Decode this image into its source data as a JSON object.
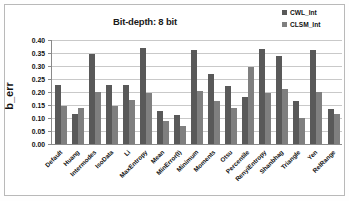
{
  "figure": {
    "title": "Bit-depth: 8 bit",
    "y_axis_title": "b_err"
  },
  "legend": {
    "position": "top-right",
    "entries": [
      {
        "label": "CWL_Int",
        "color": "#595959"
      },
      {
        "label": "CLSM_Int",
        "color": "#7f7f7f"
      }
    ]
  },
  "axis": {
    "y_ticks": [
      "0.00",
      "0.05",
      "0.10",
      "0.15",
      "0.20",
      "0.25",
      "0.30",
      "0.35",
      "0.40"
    ]
  },
  "chart_data": {
    "type": "bar",
    "title": "Bit-depth: 8 bit",
    "xlabel": "",
    "ylabel": "b_err",
    "ylim": [
      0,
      0.4
    ],
    "ytick_step": 0.05,
    "grid": true,
    "legend_position": "top-right",
    "categories": [
      "Default",
      "Huang",
      "Intermodes",
      "IsoData",
      "Li",
      "MaxEntropy",
      "Mean",
      "MinError(I)",
      "Minimum",
      "Moments",
      "Otsu",
      "Percentile",
      "RenyiEntropy",
      "Shanbhag",
      "Triangle",
      "Yen",
      "RelRange"
    ],
    "series": [
      {
        "name": "CWL_Int",
        "color": "#595959",
        "values": [
          0.228,
          0.117,
          0.345,
          0.228,
          0.228,
          0.37,
          0.127,
          0.111,
          0.361,
          0.269,
          0.223,
          0.179,
          0.364,
          0.338,
          0.164,
          0.362,
          0.135
        ]
      },
      {
        "name": "CLSM_Int",
        "color": "#7f7f7f",
        "values": [
          0.146,
          0.14,
          0.199,
          0.145,
          0.17,
          0.196,
          0.089,
          0.069,
          0.204,
          0.166,
          0.139,
          0.297,
          0.198,
          0.21,
          0.101,
          0.199,
          0.115
        ]
      }
    ]
  }
}
